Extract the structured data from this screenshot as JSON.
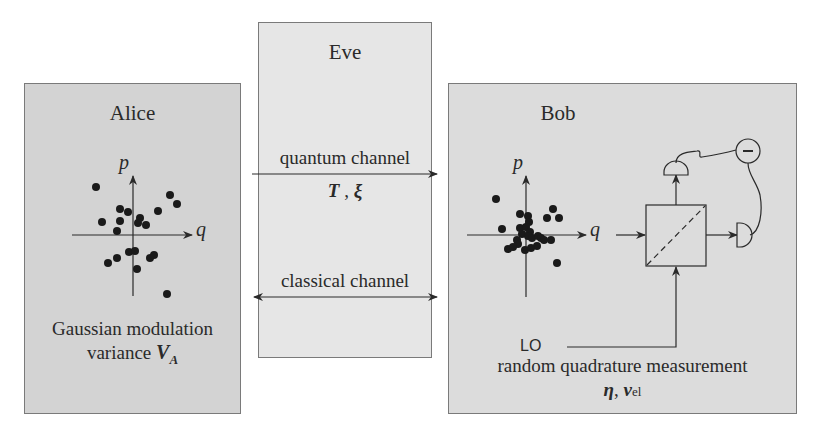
{
  "colors": {
    "alice_bg": "#d3d3d3",
    "eve_bg": "#e6e6e6",
    "bob_bg": "#dcdcdc",
    "ink": "#2a2a2a"
  },
  "alice": {
    "title": "Alice",
    "axis_p": "p",
    "axis_q": "q",
    "caption_line1": "Gaussian modulation",
    "caption_line2_text": "variance ",
    "caption_var": "V",
    "caption_sub": "A",
    "points": [
      [
        96,
        187
      ],
      [
        170,
        195
      ],
      [
        177,
        204
      ],
      [
        120,
        209
      ],
      [
        128,
        212
      ],
      [
        158,
        211
      ],
      [
        102,
        222
      ],
      [
        120,
        221
      ],
      [
        140,
        218
      ],
      [
        138,
        223
      ],
      [
        146,
        225
      ],
      [
        117,
        231
      ],
      [
        129,
        252
      ],
      [
        135,
        251
      ],
      [
        108,
        263
      ],
      [
        117,
        258
      ],
      [
        150,
        258
      ],
      [
        154,
        255
      ],
      [
        137,
        269
      ],
      [
        167,
        294
      ]
    ]
  },
  "eve": {
    "title": "Eve",
    "quantum_channel": "quantum channel",
    "quantum_params_T": "T",
    "quantum_params_sep": " , ",
    "quantum_params_xi": "ξ",
    "classical_channel": "classical channel"
  },
  "bob": {
    "title": "Bob",
    "axis_p": "p",
    "axis_q": "q",
    "lo_label": "LO",
    "subtract_symbol": "−",
    "caption_line1": "random quadrature measurement",
    "caption_eta": "η",
    "caption_sep": ", ",
    "caption_v": "v",
    "caption_sub": "el",
    "points": [
      [
        496,
        199
      ],
      [
        553,
        209
      ],
      [
        547,
        218
      ],
      [
        559,
        218
      ],
      [
        520,
        214
      ],
      [
        528,
        216
      ],
      [
        529,
        222
      ],
      [
        502,
        229
      ],
      [
        520,
        228
      ],
      [
        526,
        227
      ],
      [
        530,
        232
      ],
      [
        522,
        234
      ],
      [
        528,
        236
      ],
      [
        532,
        238
      ],
      [
        538,
        236
      ],
      [
        541,
        238
      ],
      [
        517,
        240
      ],
      [
        544,
        240
      ],
      [
        551,
        240
      ],
      [
        518,
        244
      ],
      [
        508,
        249
      ],
      [
        537,
        246
      ],
      [
        525,
        250
      ],
      [
        513,
        247
      ],
      [
        557,
        263
      ],
      [
        531,
        248
      ]
    ]
  }
}
